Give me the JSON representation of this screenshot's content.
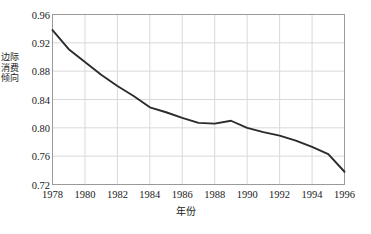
{
  "chart_data": {
    "type": "line",
    "title": "",
    "xlabel": "年份",
    "ylabel": "边际消费倾向",
    "xlim": [
      1978,
      1996
    ],
    "ylim": [
      0.72,
      0.96
    ],
    "grid": true,
    "legend": null,
    "xticks": [
      "1978",
      "1980",
      "1982",
      "1984",
      "1986",
      "1988",
      "1990",
      "1992",
      "1994",
      "1996"
    ],
    "yticks": [
      "0.72",
      "0.76",
      "0.80",
      "0.84",
      "0.88",
      "0.92",
      "0.96"
    ],
    "line_color": "#2b2b2b",
    "grid_color": "#d9d9d9",
    "border_color": "#9a9a9a",
    "x": [
      1978,
      1979,
      1980,
      1981,
      1982,
      1983,
      1984,
      1985,
      1986,
      1987,
      1988,
      1989,
      1990,
      1991,
      1992,
      1993,
      1994,
      1995,
      1996
    ],
    "values": [
      0.938,
      0.911,
      0.893,
      0.875,
      0.859,
      0.845,
      0.829,
      0.822,
      0.814,
      0.807,
      0.806,
      0.81,
      0.8,
      0.794,
      0.789,
      0.782,
      0.773,
      0.763,
      0.738
    ]
  },
  "axis": {
    "ylabel_text": "边际消费倾向",
    "xlabel_text": "年份"
  },
  "caption": {
    "text": ""
  }
}
